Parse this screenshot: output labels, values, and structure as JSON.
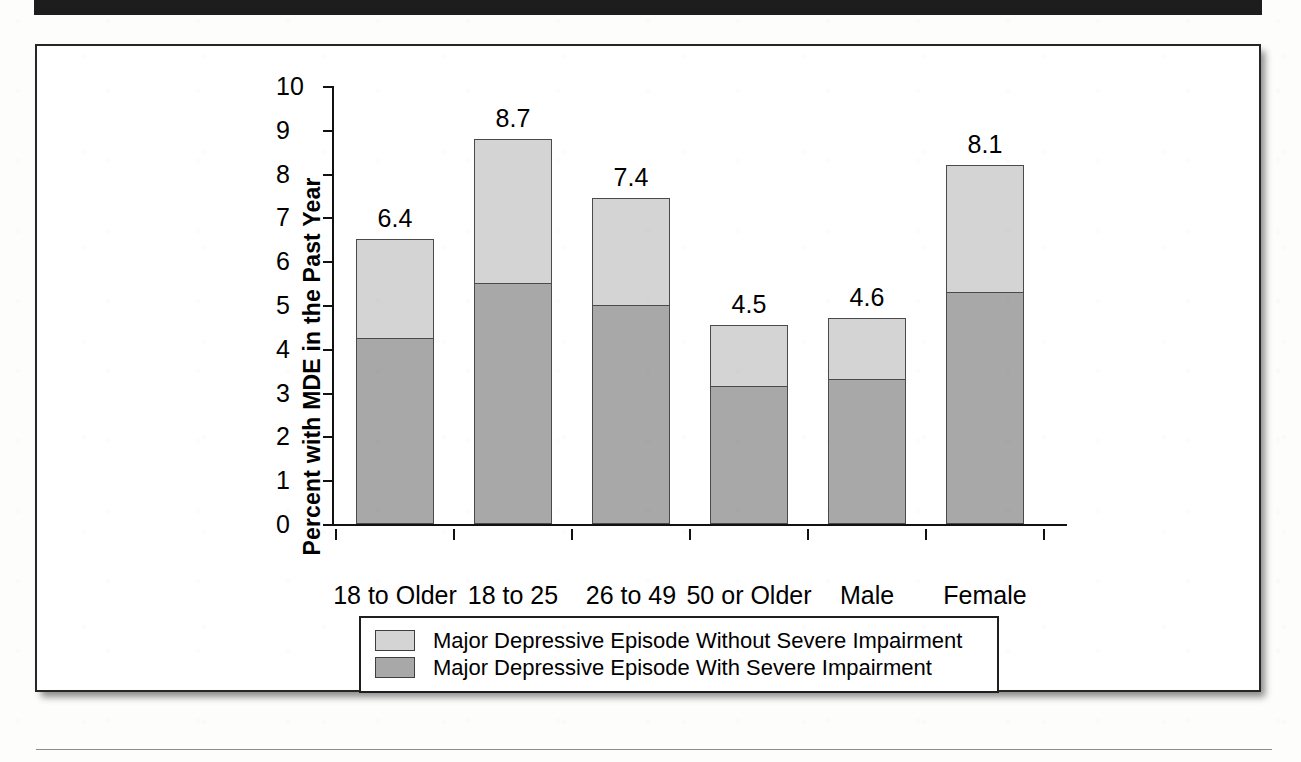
{
  "figure": {
    "frame_color": "#262626",
    "background": "#ffffff"
  },
  "chart_data": {
    "type": "bar",
    "subtype": "stacked-vertical",
    "title": "",
    "xlabel": "",
    "ylabel": "Percent with MDE in the Past Year",
    "ylim": [
      0,
      10
    ],
    "ytick_labels": [
      "0",
      "1",
      "2",
      "3",
      "4",
      "5",
      "6",
      "7",
      "8",
      "9",
      "10"
    ],
    "ytick_values": [
      0,
      1,
      2,
      3,
      4,
      5,
      6,
      7,
      8,
      9,
      10
    ],
    "grid": false,
    "legend_position": "bottom",
    "categories": [
      "18 to Older",
      "18 to 25",
      "26 to 49",
      "50 or Older",
      "Male",
      "Female"
    ],
    "group_labels": [
      {
        "label": "Age Group",
        "covers": [
          "18 to Older",
          "18 to 25",
          "26 to 49",
          "50 or Older"
        ]
      },
      {
        "label": "Gender",
        "covers": [
          "Male",
          "Female"
        ]
      }
    ],
    "series": [
      {
        "name": "Major Depressive Episode With Severe Impairment",
        "color": "#a8a8a8",
        "values": [
          4.25,
          5.5,
          5.0,
          3.15,
          3.3,
          5.3
        ]
      },
      {
        "name": "Major Depressive Episode Without Severe Impairment",
        "color": "#d4d4d4",
        "values": [
          2.25,
          3.3,
          2.45,
          1.4,
          1.4,
          2.9
        ]
      }
    ],
    "bar_totals_drawn": [
      6.5,
      8.8,
      7.45,
      4.55,
      4.7,
      8.2
    ],
    "data_labels": [
      "6.4",
      "8.7",
      "7.4",
      "4.5",
      "4.6",
      "8.1"
    ],
    "annotations": []
  },
  "legend": {
    "items": [
      {
        "label": "Major Depressive Episode Without Severe Impairment",
        "swatch": "#d4d4d4"
      },
      {
        "label": "Major Depressive Episode With Severe Impairment",
        "swatch": "#a8a8a8"
      }
    ]
  },
  "axis": {
    "y_title": "Percent with MDE in the Past Year"
  }
}
